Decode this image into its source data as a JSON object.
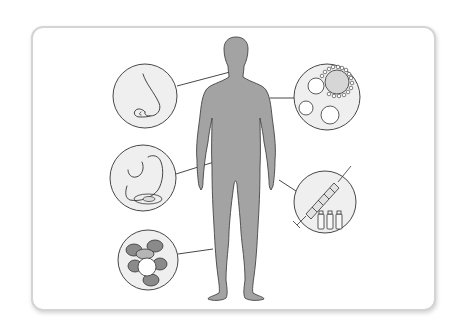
{
  "figure": {
    "fill": "#a3a3a3",
    "stroke": "#444444"
  },
  "colors": {
    "background": "#ffffff",
    "card_border": "#d4d4d4",
    "circle_fill": "#efefef",
    "line": "#333333",
    "cell_dark": "#8a8a8a",
    "cell_mid": "#c9c9c9"
  },
  "callouts": [
    {
      "id": "nose",
      "icon": "nose-icon",
      "side": "left",
      "cx": 145,
      "cy": 96,
      "r": 32,
      "connect_to": [
        230,
        72
      ]
    },
    {
      "id": "stomach",
      "icon": "stomach-icon",
      "side": "left",
      "cx": 143,
      "cy": 178,
      "r": 33,
      "connect_to": [
        214,
        162
      ]
    },
    {
      "id": "blood-cells",
      "icon": "white-blood-cell-icon",
      "side": "left",
      "cx": 148,
      "cy": 260,
      "r": 30,
      "connect_to": [
        213,
        249
      ]
    },
    {
      "id": "immune-cells",
      "icon": "cells-icon",
      "side": "right",
      "cx": 327,
      "cy": 97,
      "r": 33,
      "connect_to": [
        270,
        98
      ]
    },
    {
      "id": "syringe",
      "icon": "syringe-vaccine-icon",
      "side": "right",
      "cx": 325,
      "cy": 202,
      "r": 31,
      "connect_to": [
        279,
        180
      ]
    }
  ]
}
